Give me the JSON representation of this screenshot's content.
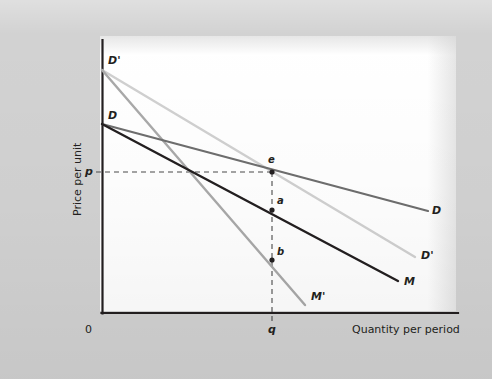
{
  "figure": {
    "background_color": "#d2d2d2",
    "plot_background_color": "#ffffff",
    "axis_color": "#231f20"
  },
  "axes": {
    "y_title": "Price per unit",
    "x_title": "Quantity per period",
    "origin_label": "0",
    "y_tick_label": "p",
    "x_tick_label": "q"
  },
  "chart_data": {
    "type": "line",
    "title": "",
    "subtitle": "",
    "xlabel": "Quantity per period",
    "ylabel": "Price per unit",
    "xlim": [
      0,
      100
    ],
    "ylim": [
      0,
      100
    ],
    "grid": false,
    "legend_position": "curve-end-labels",
    "axis_ticks": [
      {
        "axis": "y",
        "label": "p",
        "value": 51.6,
        "pixel": 172
      },
      {
        "axis": "x",
        "label": "q",
        "value": 47.8,
        "pixel": 272
      }
    ],
    "series": [
      {
        "name": "D",
        "label": "D",
        "description": "Original demand curve, flatter, dark gray",
        "color": "#6e6e6e",
        "width": 2.2,
        "points": [
          [
            102,
            124
          ],
          [
            428,
            211
          ]
        ],
        "label_pos": [
          432,
          214
        ],
        "data_points": [
          [
            0,
            68.7
          ],
          [
            91.6,
            37.1
          ]
        ]
      },
      {
        "name": "M",
        "label": "M",
        "description": "Marginal revenue for D, black, steeper than D",
        "color": "#231f20",
        "width": 2.4,
        "points": [
          [
            102,
            124
          ],
          [
            398,
            281
          ]
        ],
        "label_pos": [
          404,
          285
        ],
        "data_points": [
          [
            0,
            68.7
          ],
          [
            83.1,
            11.6
          ]
        ]
      },
      {
        "name": "Dprime",
        "label": "D'",
        "description": "New demand curve after rotation, light gray, higher intercept",
        "color": "#d0d0d0",
        "width": 2.4,
        "points": [
          [
            102,
            70
          ],
          [
            415,
            257
          ]
        ],
        "label_pos": [
          421,
          259
        ],
        "data_points": [
          [
            0,
            88.4
          ],
          [
            87.9,
            20.4
          ]
        ]
      },
      {
        "name": "Mprime",
        "label": "M'",
        "description": "Marginal revenue for D', medium gray, steepest",
        "color": "#a9a9a9",
        "width": 2.4,
        "points": [
          [
            102,
            70
          ],
          [
            305,
            305
          ]
        ],
        "label_pos": [
          311,
          300
        ],
        "data_points": [
          [
            0,
            88.4
          ],
          [
            57.0,
            2.9
          ]
        ]
      }
    ],
    "annotated_points": [
      {
        "label": "e",
        "x_pixel": 272,
        "y_pixel": 172,
        "label_pos": [
          268,
          159
        ],
        "on_curve": "D and D' intersection",
        "value": [
          47.8,
          51.6
        ]
      },
      {
        "label": "a",
        "x_pixel": 272,
        "y_pixel": 210,
        "label_pos": [
          277,
          200
        ],
        "on_curve": "M",
        "value": [
          47.8,
          37.5
        ]
      },
      {
        "label": "b",
        "x_pixel": 272,
        "y_pixel": 260,
        "label_pos": [
          277,
          250
        ],
        "on_curve": "M'",
        "value": [
          47.8,
          19.3
        ]
      }
    ],
    "guide_lines": [
      {
        "name": "price-guide",
        "from": [
          102,
          172
        ],
        "to": [
          272,
          172
        ],
        "style": "dashed"
      },
      {
        "name": "quantity-guide",
        "from": [
          272,
          172
        ],
        "to": [
          272,
          313
        ],
        "style": "dashed"
      }
    ]
  }
}
